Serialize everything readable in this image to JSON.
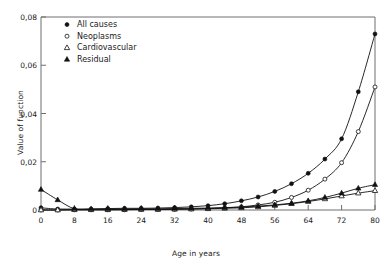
{
  "chart_data": {
    "type": "line",
    "title": "",
    "xlabel": "Age in years",
    "ylabel": "Value of function",
    "xlim": [
      0,
      80
    ],
    "ylim": [
      0,
      0.08
    ],
    "grid": false,
    "legend_position": "upper-left-inside",
    "xticks": [
      0,
      8,
      16,
      24,
      32,
      40,
      48,
      56,
      64,
      72,
      80
    ],
    "xtick_labels": [
      "0",
      "8",
      "16",
      "24",
      "32",
      "40",
      "48",
      "56",
      "64",
      "72",
      "80"
    ],
    "yticks": [
      0,
      0.02,
      0.04,
      0.06,
      0.08
    ],
    "ytick_labels": [
      "0",
      "0,02",
      "0,04",
      "0,06",
      "0,08"
    ],
    "x": [
      0,
      4,
      8,
      12,
      16,
      20,
      24,
      28,
      32,
      36,
      40,
      44,
      48,
      52,
      56,
      60,
      64,
      68,
      72,
      76,
      80
    ],
    "series": [
      {
        "name": "All causes",
        "marker": "filled-circle",
        "values": [
          0.0009,
          0.0004,
          0.0004,
          0.0004,
          0.0006,
          0.0007,
          0.0007,
          0.0008,
          0.001,
          0.0013,
          0.0018,
          0.0026,
          0.0038,
          0.0054,
          0.0077,
          0.0109,
          0.0152,
          0.0211,
          0.0295,
          0.049,
          0.073
        ]
      },
      {
        "name": "Neoplasms",
        "marker": "open-circle",
        "values": [
          0.0,
          0.0,
          0.0001,
          0.0001,
          0.0001,
          0.0001,
          0.0002,
          0.0002,
          0.0003,
          0.0004,
          0.0006,
          0.0009,
          0.0013,
          0.0021,
          0.0032,
          0.0052,
          0.0082,
          0.0128,
          0.0196,
          0.0325,
          0.051
        ]
      },
      {
        "name": "Cardiovascular",
        "marker": "open-triangle",
        "values": [
          0.0,
          0.0,
          0.0001,
          0.0001,
          0.0001,
          0.0002,
          0.0002,
          0.0002,
          0.0003,
          0.0004,
          0.0005,
          0.0007,
          0.0009,
          0.0013,
          0.0019,
          0.0026,
          0.0035,
          0.0046,
          0.0058,
          0.007,
          0.008
        ]
      },
      {
        "name": "Residual",
        "marker": "filled-triangle",
        "values": [
          0.0085,
          0.0042,
          0.0005,
          0.0004,
          0.0004,
          0.0004,
          0.0005,
          0.0005,
          0.0006,
          0.0007,
          0.0008,
          0.001,
          0.0012,
          0.0016,
          0.0021,
          0.0028,
          0.0038,
          0.0052,
          0.007,
          0.009,
          0.0105
        ]
      }
    ]
  },
  "legend": {
    "items": [
      {
        "label": "All causes"
      },
      {
        "label": "Neoplasms"
      },
      {
        "label": "Cardiovascular"
      },
      {
        "label": "Residual"
      }
    ]
  },
  "colors": {
    "line": "#111111",
    "axis": "#6e6e6e",
    "text": "#1a1a1a"
  }
}
